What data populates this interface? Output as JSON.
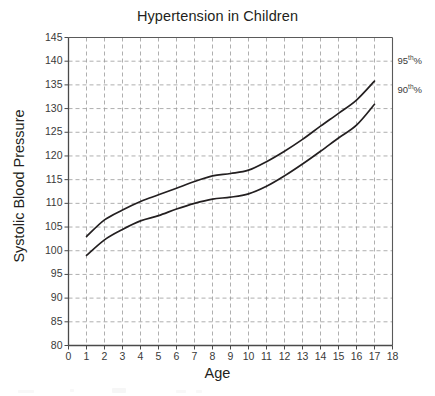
{
  "chart_data": {
    "type": "line",
    "title": "Hypertension in Children",
    "xlabel": "Age",
    "ylabel": "Systolic Blood Pressure",
    "xlim": [
      0,
      18
    ],
    "ylim": [
      80,
      145
    ],
    "xticks": [
      "0",
      "1",
      "2",
      "3",
      "4",
      "5",
      "6",
      "7",
      "8",
      "9",
      "10",
      "11",
      "12",
      "13",
      "14",
      "15",
      "16",
      "17",
      "18"
    ],
    "yticks": [
      "80",
      "85",
      "90",
      "95",
      "100",
      "105",
      "110",
      "115",
      "120",
      "125",
      "130",
      "135",
      "140",
      "145"
    ],
    "grid": true,
    "legend_position": "right-inline",
    "x": [
      1,
      2,
      3,
      4,
      5,
      6,
      7,
      8,
      9,
      10,
      11,
      12,
      13,
      14,
      15,
      16,
      17
    ],
    "series": [
      {
        "name": "95th%",
        "label_html": "95<sup>th</sup>%",
        "color": "#231f20",
        "values": [
          103.0,
          106.5,
          108.6,
          110.4,
          111.8,
          113.2,
          114.6,
          115.8,
          116.3,
          117.0,
          118.8,
          121.0,
          123.5,
          126.3,
          129.0,
          131.8,
          135.8
        ]
      },
      {
        "name": "90th%",
        "label_html": "90<sup>th</sup>%",
        "color": "#231f20",
        "values": [
          99.0,
          102.3,
          104.5,
          106.3,
          107.4,
          108.8,
          110.0,
          110.9,
          111.3,
          112.0,
          113.6,
          115.8,
          118.3,
          121.0,
          123.8,
          126.5,
          130.9
        ]
      }
    ],
    "annotations": [
      {
        "text": "95th%",
        "at_x": 18.3,
        "at_y": 140.0
      },
      {
        "text": "90th%",
        "at_x": 18.3,
        "at_y": 134.0
      }
    ]
  }
}
